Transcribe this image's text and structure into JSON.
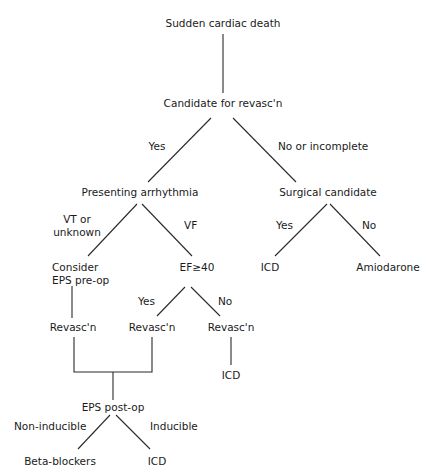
{
  "diagram": {
    "type": "decision-tree",
    "nodes": {
      "root": "Sudden cardiac death",
      "revasc_candidate": "Candidate for revasc'n",
      "presenting_arrhythmia": "Presenting arrhythmia",
      "surgical_candidate": "Surgical candidate",
      "icd_surgical": "ICD",
      "amiodarone": "Amiodarone",
      "consider_eps_line1": "Consider",
      "consider_eps_line2": "EPS pre-op",
      "ef40": "EF≥40",
      "revasc_left": "Revasc'n",
      "revasc_mid": "Revasc'n",
      "revasc_right": "Revasc'n",
      "icd_ef_no": "ICD",
      "eps_post_op": "EPS post-op",
      "beta_blockers": "Beta-blockers",
      "icd_inducible": "ICD"
    },
    "edge_labels": {
      "yes_revasc": "Yes",
      "no_or_incomplete": "No or incomplete",
      "vt_line1": "VT or",
      "vt_line2": "unknown",
      "vf": "VF",
      "surgical_yes": "Yes",
      "surgical_no": "No",
      "ef_yes": "Yes",
      "ef_no": "No",
      "non_inducible": "Non-inducible",
      "inducible": "Inducible"
    },
    "edges": [
      {
        "from": "root",
        "to": "revasc_candidate"
      },
      {
        "from": "revasc_candidate",
        "to": "presenting_arrhythmia",
        "label": "Yes"
      },
      {
        "from": "revasc_candidate",
        "to": "surgical_candidate",
        "label": "No or incomplete"
      },
      {
        "from": "surgical_candidate",
        "to": "icd_surgical",
        "label": "Yes"
      },
      {
        "from": "surgical_candidate",
        "to": "amiodarone",
        "label": "No"
      },
      {
        "from": "presenting_arrhythmia",
        "to": "consider_eps",
        "label": "VT or unknown"
      },
      {
        "from": "presenting_arrhythmia",
        "to": "ef40",
        "label": "VF"
      },
      {
        "from": "consider_eps",
        "to": "revasc_left"
      },
      {
        "from": "ef40",
        "to": "revasc_mid",
        "label": "Yes"
      },
      {
        "from": "ef40",
        "to": "revasc_right",
        "label": "No"
      },
      {
        "from": "revasc_right",
        "to": "icd_ef_no"
      },
      {
        "from": "revasc_left",
        "to": "eps_post_op"
      },
      {
        "from": "revasc_mid",
        "to": "eps_post_op"
      },
      {
        "from": "eps_post_op",
        "to": "beta_blockers",
        "label": "Non-inducible"
      },
      {
        "from": "eps_post_op",
        "to": "icd_inducible",
        "label": "Inducible"
      }
    ]
  }
}
